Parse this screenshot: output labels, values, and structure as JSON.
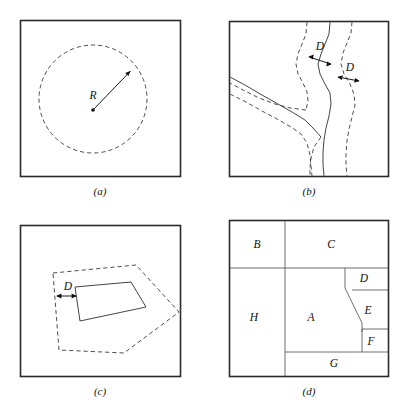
{
  "figure": {
    "background_color": "#ffffff",
    "line_color": "#303030",
    "frame_color": "#2b2b2b",
    "text_color": "#111111",
    "panels": [
      {
        "id": "a",
        "caption": "(a)",
        "description": "Point feature with circular buffer of radius R",
        "labels": [
          {
            "name": "radius-label",
            "text": "R",
            "x": 93,
            "y": 96
          }
        ]
      },
      {
        "id": "b",
        "caption": "(b)",
        "description": "Line features (river network) with buffer of width D on each side",
        "labels": [
          {
            "name": "distance-label-upper",
            "text": "D",
            "x": 320,
            "y": 48
          },
          {
            "name": "distance-label-lower",
            "text": "D",
            "x": 350,
            "y": 69
          }
        ]
      },
      {
        "id": "c",
        "caption": "(c)",
        "description": "Polygon feature with buffer of distance D",
        "labels": [
          {
            "name": "distance-label",
            "text": "D",
            "x": 69,
            "y": 288
          }
        ]
      },
      {
        "id": "d",
        "caption": "(d)",
        "description": "Map of adjacent polygons labelled A through H",
        "regions": [
          {
            "name": "region-b",
            "text": "B",
            "x": 258,
            "y": 246
          },
          {
            "name": "region-c",
            "text": "C",
            "x": 318,
            "y": 245
          },
          {
            "name": "region-d",
            "text": "D",
            "x": 359,
            "y": 280
          },
          {
            "name": "region-h",
            "text": "H",
            "x": 254,
            "y": 317
          },
          {
            "name": "region-a",
            "text": "A",
            "x": 309,
            "y": 318
          },
          {
            "name": "region-e",
            "text": "E",
            "x": 364,
            "y": 311
          },
          {
            "name": "region-f",
            "text": "F",
            "x": 366,
            "y": 341
          },
          {
            "name": "region-g",
            "text": "G",
            "x": 333,
            "y": 364
          }
        ]
      }
    ],
    "captions": [
      {
        "name": "caption-a",
        "text": "(a)",
        "x": 100,
        "y": 192
      },
      {
        "name": "caption-b",
        "text": "(b)",
        "x": 309,
        "y": 192
      },
      {
        "name": "caption-c",
        "text": "(c)",
        "x": 100,
        "y": 392
      },
      {
        "name": "caption-d",
        "text": "(d)",
        "x": 309,
        "y": 392
      }
    ]
  }
}
